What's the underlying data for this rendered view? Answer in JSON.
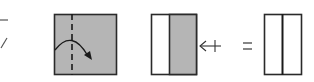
{
  "diagram": {
    "type": "origami-fold-steps",
    "colors": {
      "paper_colored": "#b5b5b5",
      "paper_white": "#ffffff",
      "stroke": "#2a2a2a",
      "arrow": "#333333"
    },
    "steps": [
      {
        "id": "partial-previous",
        "description": "cut-off fragment of previous step"
      },
      {
        "id": "step-1",
        "description": "gray square with vertical valley-fold dashed line and curved fold arrow"
      },
      {
        "id": "step-2",
        "description": "folded result: white strip on left, gray on right, with rotate/turn-over arrow"
      },
      {
        "id": "step-3",
        "description": "equals result: white rectangle with center vertical crease"
      }
    ],
    "symbols": {
      "turn_arrow": "←+",
      "equals": "="
    }
  }
}
